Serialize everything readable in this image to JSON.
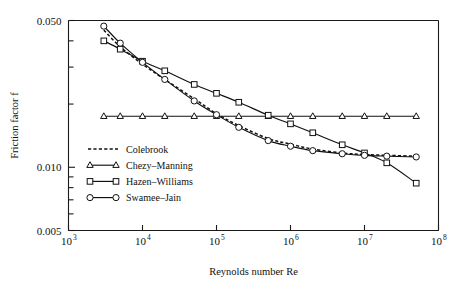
{
  "figure": {
    "background": "#ffffff",
    "foreground": "#111111"
  },
  "axes": {
    "x_title": "Reynolds number Re",
    "y_title": "Friction factor f",
    "x_ticks": [
      {
        "label_base": "10",
        "label_exp": "3",
        "value": 1000
      },
      {
        "label_base": "10",
        "label_exp": "4",
        "value": 10000
      },
      {
        "label_base": "10",
        "label_exp": "5",
        "value": 100000
      },
      {
        "label_base": "10",
        "label_exp": "6",
        "value": 1000000
      },
      {
        "label_base": "10",
        "label_exp": "7",
        "value": 10000000
      },
      {
        "label_base": "10",
        "label_exp": "8",
        "value": 100000000
      }
    ],
    "y_ticks": [
      {
        "label": "0.050",
        "value": 0.05
      },
      {
        "label": "0.010",
        "value": 0.01
      },
      {
        "label": "0.005",
        "value": 0.005
      }
    ]
  },
  "legend": {
    "items": [
      {
        "label": "Colebrook",
        "style": "dashed",
        "marker": "none"
      },
      {
        "label": "Chezy–Manning",
        "style": "solid",
        "marker": "triangle"
      },
      {
        "label": "Hazen–Williams",
        "style": "solid",
        "marker": "square"
      },
      {
        "label": "Swamee–Jain",
        "style": "solid",
        "marker": "circle"
      }
    ]
  },
  "chart_data": {
    "type": "line",
    "title": "",
    "subtitle": "",
    "xlabel": "Reynolds number Re",
    "ylabel": "Friction factor f",
    "xscale": "log",
    "yscale": "log",
    "xlim": [
      1000,
      100000000
    ],
    "ylim": [
      0.005,
      0.05
    ],
    "grid": false,
    "legend_position": "lower-left-inside",
    "x": [
      3000,
      5000,
      10000,
      20000,
      50000,
      100000,
      200000,
      500000,
      1000000,
      2000000,
      5000000,
      10000000,
      20000000,
      50000000
    ],
    "series": [
      {
        "name": "Colebrook",
        "style": "dashed",
        "marker": "none",
        "values": [
          0.045,
          0.0375,
          0.031,
          0.0262,
          0.0212,
          0.018,
          0.0158,
          0.0137,
          0.0129,
          0.0122,
          0.0117,
          0.0115,
          0.0114,
          0.0113
        ]
      },
      {
        "name": "Chezy–Manning",
        "style": "solid",
        "marker": "triangle",
        "values": [
          0.0175,
          0.0175,
          0.0175,
          0.0175,
          0.0175,
          0.0175,
          0.0175,
          0.0175,
          0.0175,
          0.0175,
          0.0175,
          0.0175,
          0.0175,
          0.0175
        ]
      },
      {
        "name": "Hazen–Williams",
        "style": "solid",
        "marker": "square",
        "values": [
          0.04,
          0.0365,
          0.032,
          0.0288,
          0.0248,
          0.0225,
          0.0204,
          0.0177,
          0.0161,
          0.0146,
          0.0128,
          0.0117,
          0.0105,
          0.0084
        ]
      },
      {
        "name": "Swamee–Jain",
        "style": "solid",
        "marker": "circle",
        "values": [
          0.047,
          0.039,
          0.0316,
          0.0262,
          0.0207,
          0.0178,
          0.0155,
          0.0134,
          0.0126,
          0.012,
          0.0116,
          0.0114,
          0.0113,
          0.0112
        ]
      }
    ]
  }
}
